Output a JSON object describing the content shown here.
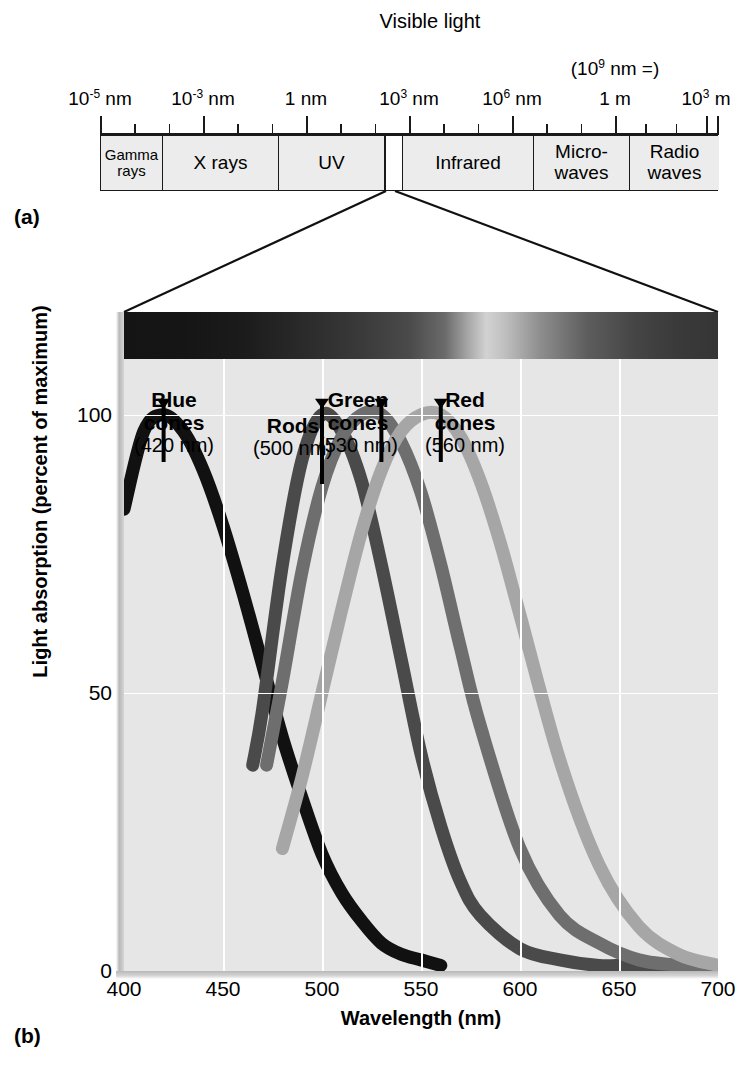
{
  "panels": {
    "a_label": "(a)",
    "b_label": "(b)"
  },
  "em_spectrum": {
    "scale_labels": [
      {
        "text": "10⁻⁵ nm",
        "base": "10",
        "exp": "-5",
        "unit": " nm",
        "x": 100
      },
      {
        "text": "10⁻³ nm",
        "base": "10",
        "exp": "-3",
        "unit": " nm",
        "x": 203
      },
      {
        "text": "1 nm",
        "base": "1",
        "exp": "",
        "unit": " nm",
        "x": 306
      },
      {
        "text": "10³ nm",
        "base": "10",
        "exp": "3",
        "unit": " nm",
        "x": 409
      },
      {
        "text": "10⁶ nm",
        "base": "10",
        "exp": "6",
        "unit": " nm",
        "x": 512
      },
      {
        "text": "1 m",
        "base": "1",
        "exp": "",
        "unit": " m",
        "x": 615
      },
      {
        "text": "10³ m",
        "base": "10",
        "exp": "3",
        "unit": " m",
        "x": 706
      }
    ],
    "annotation": {
      "base": "(10",
      "exp": "9",
      "tail": " nm =)",
      "x": 615
    },
    "bands": [
      {
        "label_line1": "Gamma",
        "label_line2": "rays",
        "left": 0,
        "width": 62
      },
      {
        "label_line1": "X rays",
        "label_line2": "",
        "left": 62,
        "width": 116
      },
      {
        "label_line1": "UV",
        "label_line2": "",
        "left": 178,
        "width": 106
      },
      {
        "label_line1": "",
        "label_line2": "",
        "left": 284,
        "width": 18,
        "visible": true
      },
      {
        "label_line1": "Infrared",
        "label_line2": "",
        "left": 302,
        "width": 131
      },
      {
        "label_line1": "Micro-",
        "label_line2": "waves",
        "left": 433,
        "width": 96
      },
      {
        "label_line1": "Radio waves",
        "label_line2": "",
        "left": 529,
        "width": 89
      }
    ]
  },
  "chart_data": {
    "type": "line",
    "title": "Visible light",
    "xlabel": "Wavelength (nm)",
    "ylabel": "Light absorption (percent of maximum)",
    "xlim": [
      400,
      700
    ],
    "ylim": [
      0,
      110
    ],
    "xticks": [
      400,
      450,
      500,
      550,
      600,
      650,
      700
    ],
    "yticks": [
      0,
      50,
      100
    ],
    "grid": true,
    "legend_position": "inline-annotations",
    "series": [
      {
        "name": "Blue cones",
        "peak_nm": 420,
        "annotation": "(420 nm)",
        "color": "#111111",
        "x": [
          400,
          410,
          420,
          430,
          440,
          450,
          460,
          470,
          480,
          490,
          500,
          510,
          520,
          530,
          540,
          550,
          560
        ],
        "values": [
          83,
          97,
          100,
          97,
          90,
          80,
          68,
          55,
          42,
          31,
          21,
          14,
          9,
          5,
          3,
          2,
          1
        ]
      },
      {
        "name": "Rods",
        "peak_nm": 500,
        "annotation": "(500 nm)",
        "color": "#4a4a4a",
        "x": [
          465,
          470,
          480,
          490,
          500,
          510,
          520,
          530,
          540,
          550,
          560,
          570,
          580,
          600,
          620,
          640,
          660,
          700
        ],
        "values": [
          37,
          47,
          73,
          92,
          100,
          97,
          88,
          73,
          56,
          39,
          26,
          16,
          10,
          4,
          2,
          1,
          1,
          0
        ]
      },
      {
        "name": "Green cones",
        "peak_nm": 530,
        "annotation": "(530 nm)",
        "color": "#6e6e6e",
        "x": [
          472,
          480,
          490,
          500,
          510,
          520,
          530,
          540,
          550,
          560,
          570,
          580,
          600,
          620,
          640,
          660,
          680,
          700
        ],
        "values": [
          37,
          52,
          72,
          87,
          96,
          100,
          100,
          95,
          86,
          73,
          58,
          44,
          22,
          10,
          5,
          2,
          1,
          0
        ]
      },
      {
        "name": "Red cones",
        "peak_nm": 560,
        "annotation": "(560 nm)",
        "color": "#a6a6a6",
        "x": [
          480,
          490,
          500,
          510,
          520,
          530,
          540,
          550,
          560,
          570,
          580,
          590,
          600,
          620,
          640,
          660,
          680,
          700
        ],
        "values": [
          22,
          35,
          50,
          65,
          79,
          90,
          97,
          100,
          100,
          96,
          88,
          77,
          64,
          38,
          19,
          8,
          3,
          1
        ]
      }
    ]
  }
}
